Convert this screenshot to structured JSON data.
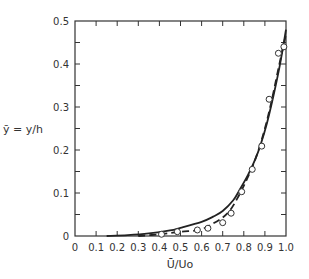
{
  "chart_data": {
    "type": "line",
    "title": "",
    "xlabel": "Ū/Uo",
    "ylabel": "ȳ = y/h",
    "xlim": [
      0,
      1.0
    ],
    "ylim": [
      0,
      0.5
    ],
    "xticks": [
      "0",
      "0.1",
      "0.2",
      "0.3",
      "0.4",
      "0.5",
      "0.6",
      "0.7",
      "0.8",
      "0.9",
      "1.0"
    ],
    "yticks": [
      "0",
      "0.1",
      "0.2",
      "0.3",
      "0.4",
      "0.5"
    ],
    "grid": false,
    "legend": null,
    "series": [
      {
        "name": "solid curve",
        "style": "solid",
        "x": [
          0.15,
          0.25,
          0.35,
          0.45,
          0.5,
          0.6,
          0.655,
          0.7,
          0.75,
          0.78,
          0.82,
          0.853,
          0.88,
          0.91,
          0.94,
          0.97,
          1.0
        ],
        "y": [
          0.0,
          0.002,
          0.006,
          0.013,
          0.019,
          0.033,
          0.045,
          0.058,
          0.083,
          0.107,
          0.142,
          0.177,
          0.213,
          0.263,
          0.325,
          0.395,
          0.48
        ]
      },
      {
        "name": "dashed curve",
        "style": "dashed",
        "x": [
          0.3,
          0.4,
          0.5,
          0.59,
          0.65,
          0.7,
          0.735,
          0.77,
          0.806,
          0.84,
          0.87,
          0.9,
          0.93,
          0.96,
          0.98,
          1.0
        ],
        "y": [
          0.0,
          0.004,
          0.01,
          0.014,
          0.028,
          0.043,
          0.06,
          0.088,
          0.123,
          0.16,
          0.2,
          0.25,
          0.31,
          0.38,
          0.425,
          0.47
        ]
      },
      {
        "name": "measured data",
        "style": "markers",
        "marker": "open-circle",
        "x": [
          0.41,
          0.485,
          0.58,
          0.63,
          0.7,
          0.74,
          0.79,
          0.84,
          0.885,
          0.92,
          0.964,
          0.99
        ],
        "y": [
          0.004,
          0.01,
          0.014,
          0.018,
          0.031,
          0.053,
          0.103,
          0.155,
          0.209,
          0.318,
          0.425,
          0.44
        ]
      }
    ]
  }
}
